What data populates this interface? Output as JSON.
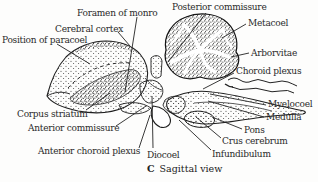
{
  "figure": {
    "kind": "anatomical-line-diagram",
    "caption": {
      "index": "C",
      "title": "Sagittal view"
    },
    "colors": {
      "background": "#fdfdfc",
      "ink": "#1e1e1e",
      "text": "#2a2a2a"
    },
    "labels": {
      "posterior_commissure": "Posterior commissure",
      "foramen_of_monro": "Foramen of monro",
      "metacoel": "Metacoel",
      "cerebral_cortex": "Cerebral cortex",
      "position_of_paracoel": "Position of paracoel",
      "arborvitae": "Arborvitae",
      "choroid_plexus": "Choroid plexus",
      "myelocoel": "Myelocoel",
      "corpus_striatum": "Corpus striatum",
      "medulla": "Medulla",
      "anterior_commissure": "Anterior commissure",
      "pons": "Pons",
      "crus_cerebrum": "Crus cerebrum",
      "anterior_choroid_plexus": "Anterior choroid plexus",
      "diocoel": "Diocoel",
      "infundibulum": "Infundibulum"
    }
  }
}
